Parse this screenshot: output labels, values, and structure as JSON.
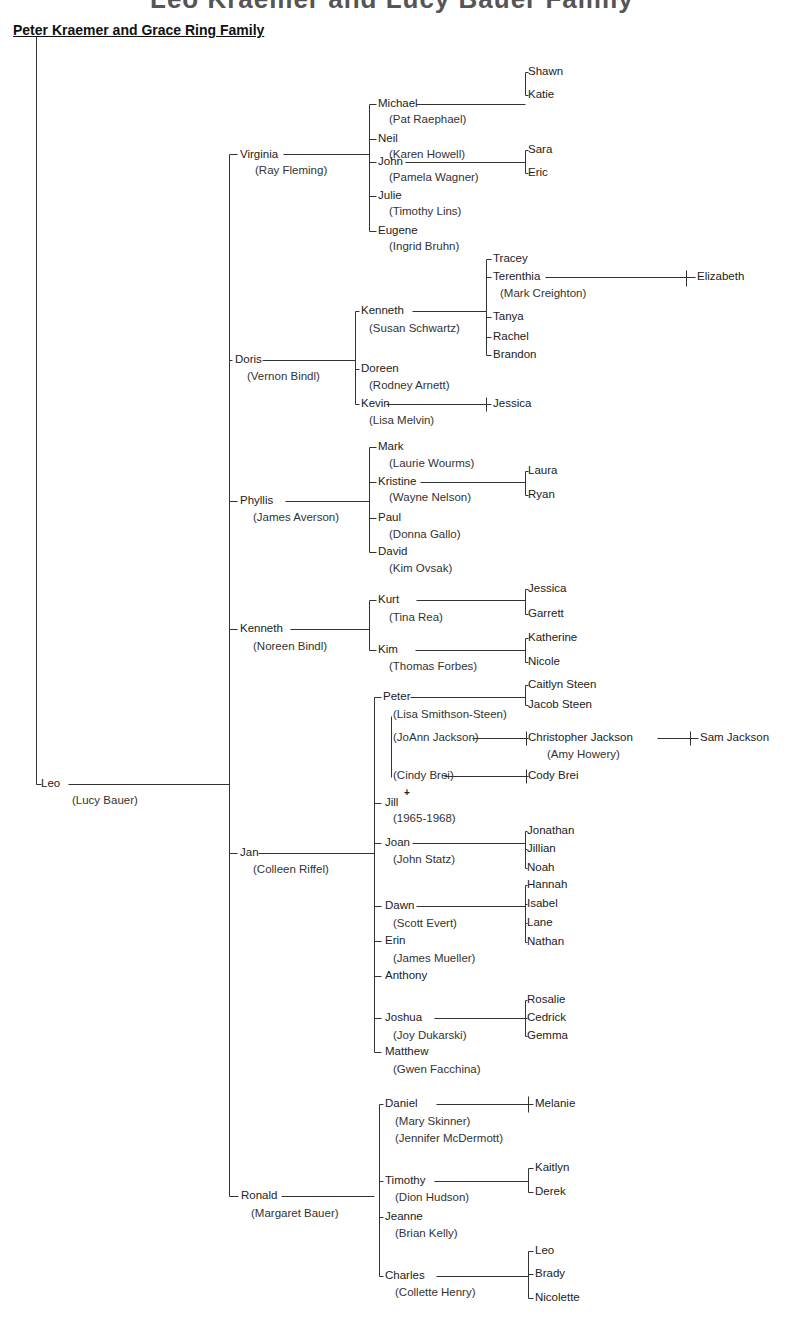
{
  "header": {
    "top_title_partial": "Leo Kraemer and Lucy Bauer Family",
    "family_title": "Peter Kraemer and Grace Ring Family"
  },
  "tree": {
    "root": {
      "name": "Leo",
      "spouse": "(Lucy Bauer)"
    },
    "children": [
      {
        "name": "Virginia",
        "spouse": "(Ray Fleming)",
        "children": [
          {
            "name": "Michael",
            "spouse": "(Pat Raephael)",
            "children": [
              "Shawn",
              "Katie"
            ]
          },
          {
            "name": "Neil",
            "spouse": "(Karen Howell)"
          },
          {
            "name": "John",
            "spouse": "(Pamela Wagner)",
            "children": [
              "Sara",
              "Eric"
            ]
          },
          {
            "name": "Julie",
            "spouse": "(Timothy Lins)"
          },
          {
            "name": "Eugene",
            "spouse": "(Ingrid Bruhn)"
          }
        ]
      },
      {
        "name": "Doris",
        "spouse": "(Vernon Bindl)",
        "children": [
          {
            "name": "Kenneth",
            "spouse": "(Susan Schwartz)",
            "children": [
              "Tracey",
              "Terenthia",
              "(Mark Creighton)",
              "Tanya",
              "Rachel",
              "Brandon"
            ],
            "grandchild": "Elizabeth"
          },
          {
            "name": "Doreen",
            "spouse": "(Rodney Arnett)"
          },
          {
            "name": "Kevin",
            "spouse": "(Lisa Melvin)",
            "children": [
              "Jessica"
            ]
          }
        ]
      },
      {
        "name": "Phyllis",
        "spouse": "(James Averson)",
        "children": [
          {
            "name": "Mark",
            "spouse": "(Laurie Wourms)"
          },
          {
            "name": "Kristine",
            "spouse": "(Wayne Nelson)",
            "children": [
              "Laura",
              "Ryan"
            ]
          },
          {
            "name": "Paul",
            "spouse": "(Donna Gallo)"
          },
          {
            "name": "David",
            "spouse": "(Kim Ovsak)"
          }
        ]
      },
      {
        "name": "Kenneth",
        "spouse": "(Noreen Bindl)",
        "children": [
          {
            "name": "Kurt",
            "spouse": "(Tina Rea)",
            "children": [
              "Jessica",
              "Garrett"
            ]
          },
          {
            "name": "Kim",
            "spouse": "(Thomas Forbes)",
            "children": [
              "Katherine",
              "Nicole"
            ]
          }
        ]
      },
      {
        "name": "Jan",
        "spouse": "(Colleen Riffel)",
        "children": [
          {
            "name": "Peter",
            "spouses": [
              "(Lisa Smithson-Steen)",
              "(JoAnn Jackson)",
              "(Cindy Brei)"
            ],
            "children": [
              "Caitlyn Steen",
              "Jacob Steen",
              "Christopher Jackson",
              "(Amy Howery)",
              "Sam Jackson",
              "Cody Brei"
            ]
          },
          {
            "name": "Jill",
            "mark": "+",
            "dates": "(1965-1968)"
          },
          {
            "name": "Joan",
            "spouse": "(John Statz)",
            "children": [
              "Jonathan",
              "Jillian",
              "Noah"
            ]
          },
          {
            "name": "Dawn",
            "spouse": "(Scott Evert)",
            "children": [
              "Hannah",
              "Isabel",
              "Lane",
              "Nathan"
            ]
          },
          {
            "name": "Erin",
            "spouse": "(James Mueller)"
          },
          {
            "name": "Anthony"
          },
          {
            "name": "Joshua",
            "spouse": "(Joy Dukarski)",
            "children": [
              "Rosalie",
              "Cedrick",
              "Gemma"
            ]
          },
          {
            "name": "Matthew",
            "spouse": "(Gwen Facchina)"
          }
        ]
      },
      {
        "name": "Ronald",
        "spouse": "(Margaret Bauer)",
        "children": [
          {
            "name": "Daniel",
            "spouses": [
              "(Mary Skinner)",
              "(Jennifer McDermott)"
            ],
            "children": [
              "Melanie"
            ]
          },
          {
            "name": "Timothy",
            "spouse": "(Dion Hudson)",
            "children": [
              "Kaitlyn",
              "Derek"
            ]
          },
          {
            "name": "Jeanne",
            "spouse": "(Brian Kelly)"
          },
          {
            "name": "Charles",
            "spouse": "(Collette Henry)",
            "children": [
              "Leo",
              "Brady",
              "Nicolette"
            ]
          }
        ]
      }
    ]
  },
  "labels": [
    {
      "id": "leo",
      "text": "Leo"
    },
    {
      "id": "leo_sp",
      "text": "(Lucy Bauer)"
    },
    {
      "id": "virginia",
      "text": "Virginia"
    },
    {
      "id": "virginia_sp",
      "text": "(Ray Fleming)"
    },
    {
      "id": "michael",
      "text": "Michael"
    },
    {
      "id": "michael_sp",
      "text": "(Pat Raephael)"
    },
    {
      "id": "shawn",
      "text": "Shawn"
    },
    {
      "id": "katie",
      "text": "Katie"
    },
    {
      "id": "neil",
      "text": "Neil"
    },
    {
      "id": "neil_sp",
      "text": "(Karen Howell)"
    },
    {
      "id": "john",
      "text": "John"
    },
    {
      "id": "john_sp",
      "text": "(Pamela Wagner)"
    },
    {
      "id": "sara",
      "text": "Sara"
    },
    {
      "id": "eric",
      "text": "Eric"
    },
    {
      "id": "julie",
      "text": "Julie"
    },
    {
      "id": "julie_sp",
      "text": "(Timothy Lins)"
    },
    {
      "id": "eugene",
      "text": "Eugene"
    },
    {
      "id": "eugene_sp",
      "text": "(Ingrid Bruhn)"
    },
    {
      "id": "doris",
      "text": "Doris"
    },
    {
      "id": "doris_sp",
      "text": "(Vernon Bindl)"
    },
    {
      "id": "kenneth2",
      "text": "Kenneth"
    },
    {
      "id": "kenneth2_sp",
      "text": "(Susan Schwartz)"
    },
    {
      "id": "tracey",
      "text": "Tracey"
    },
    {
      "id": "terenthia",
      "text": "Terenthia"
    },
    {
      "id": "terenthia_sp",
      "text": "(Mark Creighton)"
    },
    {
      "id": "elizabeth",
      "text": "Elizabeth"
    },
    {
      "id": "tanya",
      "text": "Tanya"
    },
    {
      "id": "rachel",
      "text": "Rachel"
    },
    {
      "id": "brandon",
      "text": "Brandon"
    },
    {
      "id": "doreen",
      "text": "Doreen"
    },
    {
      "id": "doreen_sp",
      "text": "(Rodney Arnett)"
    },
    {
      "id": "kevin",
      "text": "Kevin"
    },
    {
      "id": "kevin_sp",
      "text": "(Lisa Melvin)"
    },
    {
      "id": "jessica1",
      "text": "Jessica"
    },
    {
      "id": "phyllis",
      "text": "Phyllis"
    },
    {
      "id": "phyllis_sp",
      "text": "(James Averson)"
    },
    {
      "id": "mark",
      "text": "Mark"
    },
    {
      "id": "mark_sp",
      "text": "(Laurie Wourms)"
    },
    {
      "id": "kristine",
      "text": "Kristine"
    },
    {
      "id": "kristine_sp",
      "text": "(Wayne Nelson)"
    },
    {
      "id": "laura",
      "text": "Laura"
    },
    {
      "id": "ryan",
      "text": "Ryan"
    },
    {
      "id": "paul",
      "text": "Paul"
    },
    {
      "id": "paul_sp",
      "text": "(Donna Gallo)"
    },
    {
      "id": "david",
      "text": "David"
    },
    {
      "id": "david_sp",
      "text": "(Kim Ovsak)"
    },
    {
      "id": "kenneth1",
      "text": "Kenneth"
    },
    {
      "id": "kenneth1_sp",
      "text": "(Noreen Bindl)"
    },
    {
      "id": "kurt",
      "text": "Kurt"
    },
    {
      "id": "kurt_sp",
      "text": "(Tina Rea)"
    },
    {
      "id": "jessica2",
      "text": "Jessica"
    },
    {
      "id": "garrett",
      "text": "Garrett"
    },
    {
      "id": "kim",
      "text": "Kim"
    },
    {
      "id": "kim_sp",
      "text": "(Thomas Forbes)"
    },
    {
      "id": "katherine",
      "text": "Katherine"
    },
    {
      "id": "nicole",
      "text": "Nicole"
    },
    {
      "id": "jan",
      "text": "Jan"
    },
    {
      "id": "jan_sp",
      "text": "(Colleen Riffel)"
    },
    {
      "id": "peter",
      "text": "Peter"
    },
    {
      "id": "caitlyn",
      "text": "Caitlyn Steen"
    },
    {
      "id": "jacob",
      "text": "Jacob Steen"
    },
    {
      "id": "peter_sp1",
      "text": "(Lisa  Smithson-Steen)"
    },
    {
      "id": "peter_sp2",
      "text": "(JoAnn Jackson)"
    },
    {
      "id": "christopher",
      "text": "Christopher Jackson"
    },
    {
      "id": "christopher_sp",
      "text": "(Amy Howery)"
    },
    {
      "id": "sam",
      "text": "Sam Jackson"
    },
    {
      "id": "peter_sp3",
      "text": "(Cindy Brei)"
    },
    {
      "id": "cody",
      "text": "Cody Brei"
    },
    {
      "id": "jill",
      "text": "Jill"
    },
    {
      "id": "jill_mark",
      "text": "+"
    },
    {
      "id": "jill_dates",
      "text": "(1965-1968)"
    },
    {
      "id": "joan",
      "text": "Joan"
    },
    {
      "id": "joan_sp",
      "text": "(John Statz)"
    },
    {
      "id": "jonathan",
      "text": "Jonathan"
    },
    {
      "id": "jillian",
      "text": "Jillian"
    },
    {
      "id": "noah",
      "text": "Noah"
    },
    {
      "id": "dawn",
      "text": "Dawn"
    },
    {
      "id": "dawn_sp",
      "text": "(Scott Evert)"
    },
    {
      "id": "hannah",
      "text": "Hannah"
    },
    {
      "id": "isabel",
      "text": "Isabel"
    },
    {
      "id": "lane",
      "text": "Lane"
    },
    {
      "id": "nathan",
      "text": "Nathan"
    },
    {
      "id": "erin",
      "text": "Erin"
    },
    {
      "id": "erin_sp",
      "text": "(James Mueller)"
    },
    {
      "id": "anthony",
      "text": "Anthony"
    },
    {
      "id": "joshua",
      "text": "Joshua"
    },
    {
      "id": "joshua_sp",
      "text": "(Joy Dukarski)"
    },
    {
      "id": "rosalie",
      "text": "Rosalie"
    },
    {
      "id": "cedrick",
      "text": "Cedrick"
    },
    {
      "id": "gemma",
      "text": "Gemma"
    },
    {
      "id": "matthew",
      "text": "Matthew"
    },
    {
      "id": "matthew_sp",
      "text": "(Gwen Facchina)"
    },
    {
      "id": "ronald",
      "text": "Ronald"
    },
    {
      "id": "ronald_sp",
      "text": "(Margaret Bauer)"
    },
    {
      "id": "daniel",
      "text": "Daniel"
    },
    {
      "id": "daniel_sp1",
      "text": "(Mary Skinner)"
    },
    {
      "id": "daniel_sp2",
      "text": "(Jennifer McDermott)"
    },
    {
      "id": "melanie",
      "text": "Melanie"
    },
    {
      "id": "timothy",
      "text": "Timothy"
    },
    {
      "id": "timothy_sp",
      "text": "(Dion Hudson)"
    },
    {
      "id": "kaitlyn",
      "text": "Kaitlyn"
    },
    {
      "id": "derek",
      "text": "Derek"
    },
    {
      "id": "jeanne",
      "text": "Jeanne"
    },
    {
      "id": "jeanne_sp",
      "text": "(Brian Kelly)"
    },
    {
      "id": "charles",
      "text": "Charles"
    },
    {
      "id": "charles_sp",
      "text": "(Collette Henry)"
    },
    {
      "id": "leo2",
      "text": "Leo"
    },
    {
      "id": "brady",
      "text": "Brady"
    },
    {
      "id": "nicolette",
      "text": "Nicolette"
    }
  ]
}
